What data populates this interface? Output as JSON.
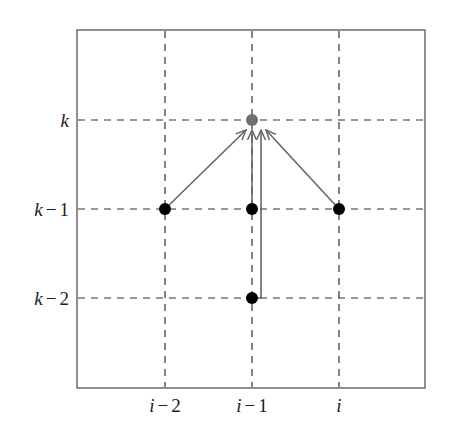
{
  "diagram": {
    "x_labels": [
      {
        "var": "i",
        "op": "−",
        "num": "2"
      },
      {
        "var": "i",
        "op": "−",
        "num": "1"
      },
      {
        "var": "i",
        "op": "",
        "num": ""
      }
    ],
    "y_labels": [
      {
        "var": "k",
        "op": "",
        "num": ""
      },
      {
        "var": "k",
        "op": "−",
        "num": "1"
      },
      {
        "var": "k",
        "op": "−",
        "num": "2"
      }
    ],
    "nodes": [
      {
        "id": "target",
        "col": "i-1",
        "row": "k",
        "color": "#707070"
      },
      {
        "id": "src1",
        "col": "i-2",
        "row": "k-1",
        "color": "#000000"
      },
      {
        "id": "src2",
        "col": "i-1",
        "row": "k-1",
        "color": "#000000"
      },
      {
        "id": "src3",
        "col": "i",
        "row": "k-1",
        "color": "#000000"
      },
      {
        "id": "src4",
        "col": "i-1",
        "row": "k-2",
        "color": "#000000"
      }
    ],
    "edges": [
      {
        "from": "src1",
        "to": "target"
      },
      {
        "from": "src2",
        "to": "target"
      },
      {
        "from": "src3",
        "to": "target"
      },
      {
        "from": "src4",
        "to": "target"
      }
    ],
    "colors": {
      "frame": "#555555",
      "grid": "#333333",
      "arrow": "#666666"
    }
  }
}
